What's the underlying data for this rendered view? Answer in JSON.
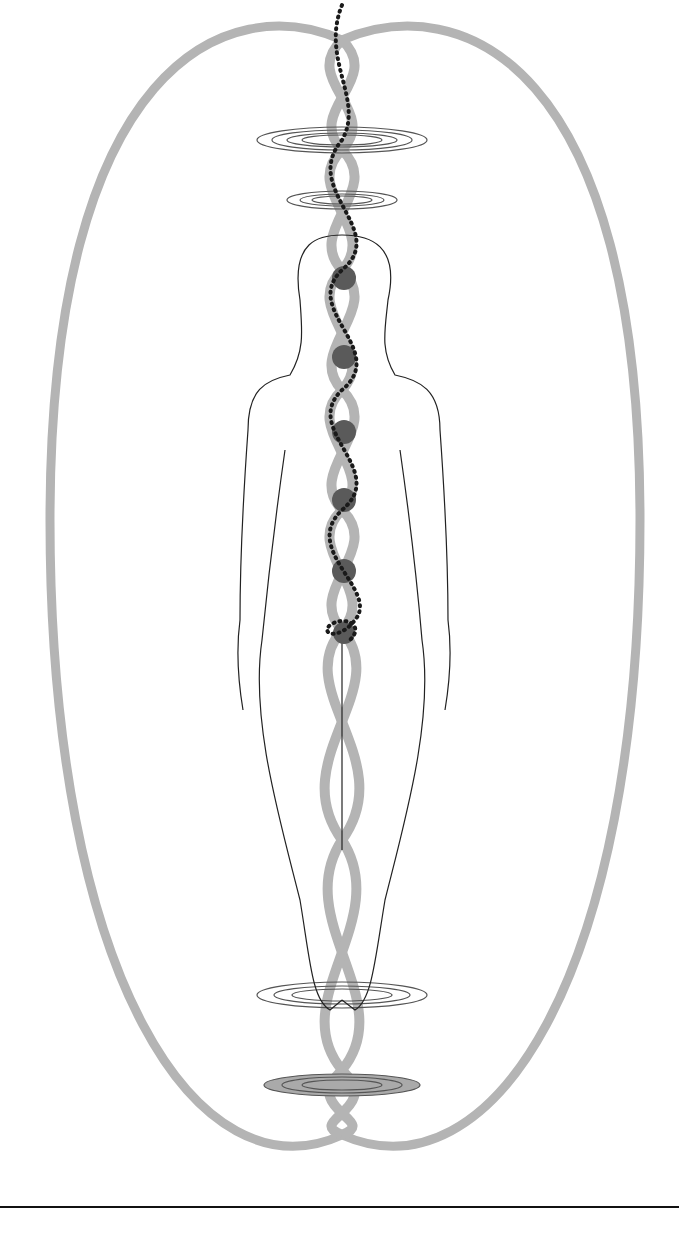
{
  "illustration": {
    "subject": "human figure with energy field, chakras and double helix",
    "chakra_count": 6,
    "chakras_y": [
      278,
      357,
      432,
      500,
      571,
      633
    ],
    "colors": {
      "field": "#b4b4b4",
      "chakra": "#5a5a5a",
      "beads": "#1a1a1a",
      "outline": "#222222",
      "rings": "#555555"
    }
  }
}
